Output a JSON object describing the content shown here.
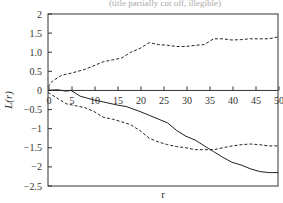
{
  "chart_data": {
    "type": "line",
    "title": "(title partially cut off, illegible)",
    "xlabel": "r",
    "ylabel": "L(r)",
    "xlim": [
      0,
      50
    ],
    "ylim": [
      -2.5,
      2
    ],
    "grid": false,
    "legend": null,
    "x_ticks": [
      "0",
      "5",
      "10",
      "15",
      "20",
      "25",
      "30",
      "35",
      "40",
      "45",
      "50"
    ],
    "y_ticks": [
      "2",
      "1.5",
      "1.0",
      "0.5",
      "0",
      "-0.5",
      "-1",
      "-1.5",
      "-2",
      "-2.5"
    ],
    "x_axis_position": "y=0 (ticks drawn on zero line, labels below it)",
    "series": [
      {
        "name": "upper envelope",
        "style": "dashed",
        "x": [
          0,
          1,
          3,
          5,
          8,
          10,
          12,
          14,
          16,
          18,
          20,
          22,
          24,
          26,
          28,
          30,
          32,
          34,
          36,
          38,
          40,
          42,
          44,
          46,
          48,
          50
        ],
        "values": [
          0.1,
          0.25,
          0.4,
          0.45,
          0.55,
          0.65,
          0.75,
          0.8,
          0.85,
          1.0,
          1.1,
          1.25,
          1.2,
          1.18,
          1.15,
          1.15,
          1.18,
          1.2,
          1.35,
          1.35,
          1.32,
          1.33,
          1.35,
          1.35,
          1.35,
          1.4
        ]
      },
      {
        "name": "L(r)",
        "style": "solid",
        "x": [
          0,
          2,
          4,
          5,
          7,
          10,
          12,
          15,
          17,
          20,
          22,
          24,
          26,
          28,
          30,
          32,
          34,
          36,
          38,
          40,
          42,
          44,
          46,
          48,
          50
        ],
        "values": [
          0,
          0.02,
          -0.02,
          0,
          -0.15,
          -0.25,
          -0.3,
          -0.38,
          -0.42,
          -0.55,
          -0.65,
          -0.75,
          -0.85,
          -1.05,
          -1.2,
          -1.3,
          -1.45,
          -1.6,
          -1.75,
          -1.88,
          -1.95,
          -2.05,
          -2.12,
          -2.15,
          -2.15
        ]
      },
      {
        "name": "lower envelope",
        "style": "dashed",
        "x": [
          0,
          2,
          4,
          6,
          8,
          10,
          12,
          14,
          16,
          18,
          20,
          22,
          24,
          26,
          28,
          30,
          32,
          34,
          36,
          38,
          40,
          42,
          44,
          46,
          48,
          50
        ],
        "values": [
          -0.05,
          -0.2,
          -0.35,
          -0.4,
          -0.45,
          -0.55,
          -0.7,
          -0.75,
          -0.82,
          -0.9,
          -1.05,
          -1.25,
          -1.35,
          -1.42,
          -1.47,
          -1.5,
          -1.55,
          -1.55,
          -1.55,
          -1.5,
          -1.45,
          -1.42,
          -1.4,
          -1.42,
          -1.45,
          -1.45
        ]
      }
    ]
  },
  "colors": {
    "line": "#222222",
    "frame": "#333333",
    "background": "#ffffff"
  }
}
